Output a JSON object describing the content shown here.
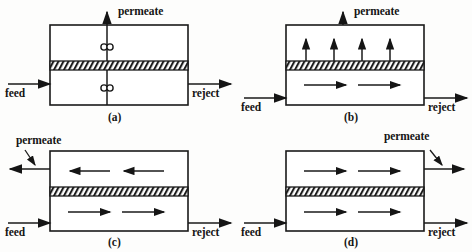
{
  "figure": {
    "title": "",
    "background_color": "#fdfdfc",
    "ink_color": "#151515",
    "panel_count": 4
  },
  "labels": {
    "feed": "feed",
    "reject": "reject",
    "permeate": "permeate"
  },
  "panels": [
    {
      "id": "(a)",
      "name": "dead-end-permeate-valves",
      "position": {
        "left": 0,
        "top": 0
      },
      "box": {
        "x": 50,
        "y": 25,
        "w": 138,
        "h": 80
      },
      "membrane": {
        "y": 61,
        "h": 9
      },
      "feed": {
        "label": "feed",
        "side": "left",
        "y": 84
      },
      "reject": {
        "label": "reject",
        "side": "right",
        "y": 84
      },
      "permeate": {
        "label": "permeate",
        "direction": "up",
        "x": 107,
        "label_x": 118,
        "label_y": 8
      },
      "valves": [
        {
          "x": 107,
          "y": 47,
          "chamber": "upper"
        },
        {
          "x": 107,
          "y": 88,
          "chamber": "lower"
        }
      ],
      "upper_arrows": [],
      "lower_arrows": []
    },
    {
      "id": "(b)",
      "name": "cross-flow-distributed-permeation",
      "position": {
        "left": 236,
        "top": 0
      },
      "box": {
        "x": 50,
        "y": 25,
        "w": 138,
        "h": 80
      },
      "membrane": {
        "y": 61,
        "h": 9
      },
      "feed": {
        "label": "feed",
        "side": "left",
        "y": 84
      },
      "reject": {
        "label": "reject",
        "side": "right",
        "y": 84
      },
      "permeate": {
        "label": "permeate",
        "direction": "up",
        "x": 107,
        "label_x": 118,
        "label_y": 8
      },
      "valves": [],
      "upper_arrows": [
        {
          "x": 70,
          "dir": "up"
        },
        {
          "x": 98,
          "dir": "up"
        },
        {
          "x": 126,
          "dir": "up"
        },
        {
          "x": 154,
          "dir": "up"
        }
      ],
      "lower_arrows": [
        {
          "x": 68,
          "dir": "right"
        },
        {
          "x": 122,
          "dir": "right"
        }
      ]
    },
    {
      "id": "(c)",
      "name": "counter-current-flow",
      "position": {
        "left": 0,
        "top": 126
      },
      "box": {
        "x": 50,
        "y": 25,
        "w": 138,
        "h": 80
      },
      "membrane": {
        "y": 61,
        "h": 9
      },
      "feed": {
        "label": "feed",
        "side": "left",
        "y": 84
      },
      "reject": {
        "label": "reject",
        "side": "right",
        "y": 84
      },
      "permeate": {
        "label": "permeate",
        "direction": "left",
        "y": 43,
        "label_x": 18,
        "label_y": 10
      },
      "valves": [],
      "upper_arrows": [
        {
          "x": 72,
          "dir": "left"
        },
        {
          "x": 126,
          "dir": "left"
        }
      ],
      "lower_arrows": [
        {
          "x": 68,
          "dir": "right"
        },
        {
          "x": 122,
          "dir": "right"
        }
      ]
    },
    {
      "id": "(d)",
      "name": "co-current-flow",
      "position": {
        "left": 236,
        "top": 126
      },
      "box": {
        "x": 50,
        "y": 25,
        "w": 138,
        "h": 80
      },
      "membrane": {
        "y": 61,
        "h": 9
      },
      "feed": {
        "label": "feed",
        "side": "left",
        "y": 84
      },
      "reject": {
        "label": "reject",
        "side": "right",
        "y": 84
      },
      "permeate": {
        "label": "permeate",
        "direction": "right",
        "y": 43,
        "label_x": 150,
        "label_y": 6
      },
      "valves": [],
      "upper_arrows": [
        {
          "x": 68,
          "dir": "right"
        },
        {
          "x": 122,
          "dir": "right"
        }
      ],
      "lower_arrows": [
        {
          "x": 68,
          "dir": "right"
        },
        {
          "x": 122,
          "dir": "right"
        }
      ]
    }
  ]
}
